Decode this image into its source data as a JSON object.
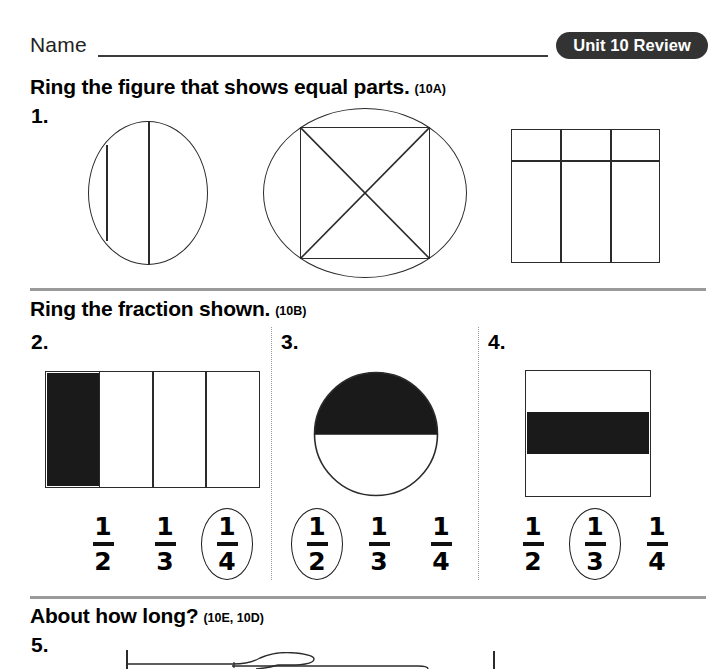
{
  "header": {
    "name_label": "Name",
    "unit_badge": "Unit 10 Review"
  },
  "sections": [
    {
      "id": "equal-parts",
      "heading": "Ring the figure that shows equal parts.",
      "code": "(10A)",
      "problems": [
        {
          "number": "1.",
          "figures": [
            {
              "name": "circle-two-chords",
              "desc": "circle divided by two vertical chords into unequal parts"
            },
            {
              "name": "circle-inscribed-square-x",
              "desc": "circle with inscribed square crossed by both diagonals"
            },
            {
              "name": "rectangle-six-parts",
              "desc": "rectangle split into three columns and one horizontal line"
            }
          ]
        }
      ]
    },
    {
      "id": "ring-fraction",
      "heading": "Ring the fraction shown.",
      "code": "(10B)",
      "problems": [
        {
          "number": "2.",
          "figure": "bar-fourths-one-shaded",
          "shaded": 1,
          "parts": 4,
          "choices": [
            {
              "numerator": "1",
              "denominator": "2",
              "ringed": false
            },
            {
              "numerator": "1",
              "denominator": "3",
              "ringed": false
            },
            {
              "numerator": "1",
              "denominator": "4",
              "ringed": true
            }
          ]
        },
        {
          "number": "3.",
          "figure": "circle-half-shaded",
          "shaded": 1,
          "parts": 2,
          "choices": [
            {
              "numerator": "1",
              "denominator": "2",
              "ringed": true
            },
            {
              "numerator": "1",
              "denominator": "3",
              "ringed": false
            },
            {
              "numerator": "1",
              "denominator": "4",
              "ringed": false
            }
          ]
        },
        {
          "number": "4.",
          "figure": "square-thirds-middle-shaded",
          "shaded": 1,
          "parts": 3,
          "choices": [
            {
              "numerator": "1",
              "denominator": "2",
              "ringed": false
            },
            {
              "numerator": "1",
              "denominator": "3",
              "ringed": true
            },
            {
              "numerator": "1",
              "denominator": "4",
              "ringed": false
            }
          ]
        }
      ]
    },
    {
      "id": "about-how-long",
      "heading": "About how long?",
      "code": "(10E, 10D)",
      "problems": [
        {
          "number": "5.",
          "figure": "knife-between-endpoint-ticks"
        }
      ]
    }
  ],
  "colors": {
    "badge_background": "#333333",
    "badge_text": "#ffffff",
    "rule_gray": "#9a9a9a",
    "ink": "#2b2b2b",
    "shade_fill": "#1a1a1a"
  }
}
